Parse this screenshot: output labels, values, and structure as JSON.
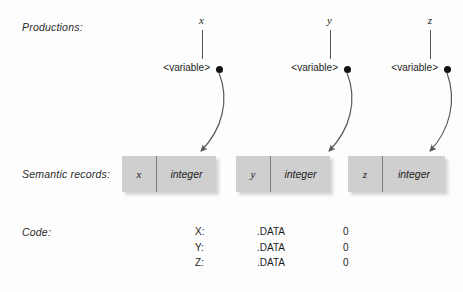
{
  "figure": {
    "background_color": "#fdfdfd",
    "box_fill_color": "#cfcfcf",
    "box_divider_color": "#7e7e7e",
    "ink_color": "#1d1d1d"
  },
  "row_labels": {
    "productions": "Productions:",
    "semantic_records": "Semantic records:",
    "code": "Code:"
  },
  "productions": [
    {
      "variable": "x",
      "nonterminal": "<variable>",
      "dot": "attribute-dot"
    },
    {
      "variable": "y",
      "nonterminal": "<variable>",
      "dot": "attribute-dot"
    },
    {
      "variable": "z",
      "nonterminal": "<variable>",
      "dot": "attribute-dot"
    }
  ],
  "semantic_records": [
    {
      "name": "x",
      "type": "integer"
    },
    {
      "name": "y",
      "type": "integer"
    },
    {
      "name": "z",
      "type": "integer"
    }
  ],
  "code": {
    "rows": [
      {
        "label": "X:",
        "op": ".DATA",
        "value": "0"
      },
      {
        "label": "Y:",
        "op": ".DATA",
        "value": "0"
      },
      {
        "label": "Z:",
        "op": ".DATA",
        "value": "0"
      }
    ]
  }
}
